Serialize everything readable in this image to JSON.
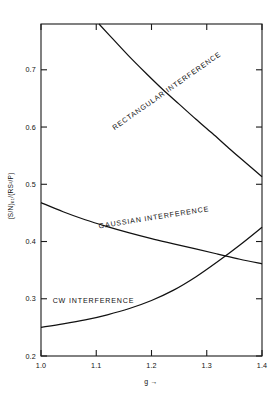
{
  "chart_data": {
    "type": "line",
    "title": "",
    "xlabel": "g →",
    "ylabel": "(S/N)₀₁/(RS²/P)",
    "xlim": [
      1.0,
      1.4
    ],
    "ylim": [
      0.2,
      0.78
    ],
    "grid": false,
    "legend": "inline-curve-labels",
    "xticks": [
      "1.0",
      "1.1",
      "1.2",
      "1.3",
      "1.4"
    ],
    "xtick_values": [
      1.0,
      1.1,
      1.2,
      1.3,
      1.4
    ],
    "yticks": [
      "0.2",
      "0.3",
      "0.4",
      "0.5",
      "0.6",
      "0.7"
    ],
    "ytick_values": [
      0.2,
      0.3,
      0.4,
      0.5,
      0.6,
      0.7
    ],
    "series": [
      {
        "name": "RECTANGULAR INTERFERENCE",
        "label_angle": 35,
        "x": [
          1.105,
          1.13,
          1.16,
          1.19,
          1.22,
          1.25,
          1.28,
          1.31,
          1.34,
          1.37,
          1.4
        ],
        "values": [
          0.78,
          0.754,
          0.723,
          0.694,
          0.666,
          0.64,
          0.614,
          0.589,
          0.563,
          0.538,
          0.513
        ]
      },
      {
        "name": "GAUSSIAN INTERFERENCE",
        "label_angle": 9,
        "x": [
          1.0,
          1.04,
          1.08,
          1.12,
          1.16,
          1.2,
          1.24,
          1.28,
          1.32,
          1.36,
          1.4
        ],
        "values": [
          0.468,
          0.452,
          0.438,
          0.426,
          0.415,
          0.405,
          0.396,
          0.387,
          0.378,
          0.369,
          0.361
        ]
      },
      {
        "name": "CW INTERFERENCE",
        "label_angle": 0,
        "x": [
          1.0,
          1.04,
          1.08,
          1.12,
          1.16,
          1.2,
          1.24,
          1.28,
          1.32,
          1.36,
          1.4
        ],
        "values": [
          0.25,
          0.256,
          0.263,
          0.272,
          0.283,
          0.297,
          0.315,
          0.338,
          0.365,
          0.394,
          0.425
        ]
      }
    ],
    "annotations": [
      {
        "text": "RECTANGULAR INTERFERENCE",
        "x": 1.23,
        "y": 0.66,
        "rotate": 35
      },
      {
        "text": "GAUSSIAN INTERFERENCE",
        "x": 1.205,
        "y": 0.438,
        "rotate": 9
      },
      {
        "text": "CW INTERFERENCE",
        "x": 1.095,
        "y": 0.292,
        "rotate": 0
      }
    ]
  },
  "figure": {
    "background_color": "#ffffff",
    "line_color": "#111111",
    "axis_color": "#1a1a1a"
  }
}
